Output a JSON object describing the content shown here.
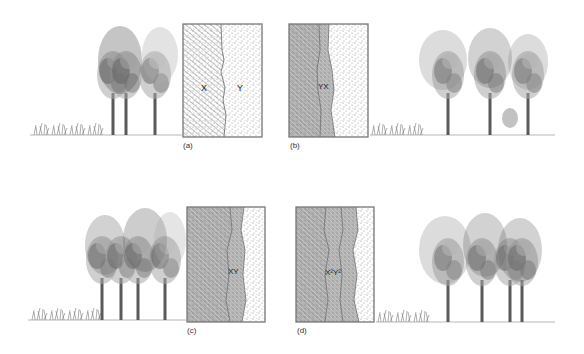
{
  "figure": {
    "colors": {
      "border": "#777777",
      "hatch": "#8a8a8a",
      "stipple": "#9a9a9a",
      "ecotone": "#b8b8b8",
      "tree_dark": "#555555",
      "tree_light": "#9a9a9a"
    },
    "panels": [
      {
        "id": "a",
        "caption": "(a)",
        "labels": [
          "X",
          "Y"
        ],
        "ecotone": "none",
        "trees_side": "left"
      },
      {
        "id": "b",
        "caption": "(b)",
        "labels": [
          "YX"
        ],
        "ecotone": "single narrow",
        "trees_side": "right"
      },
      {
        "id": "c",
        "caption": "(c)",
        "labels": [
          "XY"
        ],
        "ecotone": "single wider",
        "trees_side": "left"
      },
      {
        "id": "d",
        "caption": "(d)",
        "labels": [
          "X",
          "Y",
          "XY"
        ],
        "label_text": "X²Y²",
        "ecotone": "double",
        "trees_side": "right"
      }
    ]
  }
}
